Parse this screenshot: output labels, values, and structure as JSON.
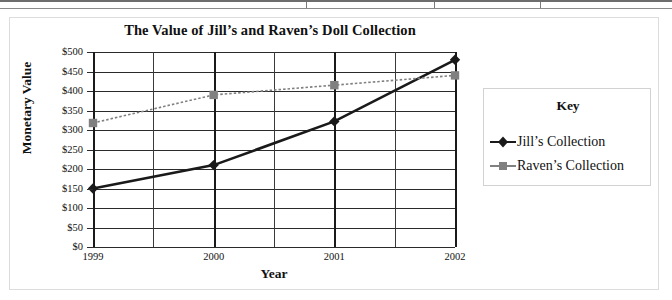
{
  "chart_data": {
    "type": "line",
    "title": "The Value of Jill’s and Raven’s Doll Collection",
    "xlabel": "Year",
    "ylabel": "Monetary Value",
    "categories": [
      "1999",
      "2000",
      "2001",
      "2002"
    ],
    "x": [
      1999,
      2000,
      2001,
      2002
    ],
    "series": [
      {
        "name": "Jill’s Collection",
        "values": [
          150,
          210,
          322,
          480
        ],
        "color": "#1a1a1a",
        "marker": "diamond",
        "line_style": "solid"
      },
      {
        "name": "Raven’s Collection",
        "values": [
          318,
          390,
          415,
          440
        ],
        "color": "#808080",
        "marker": "square",
        "line_style": "dotted"
      }
    ],
    "ylim": [
      0,
      500
    ],
    "ytick_labels": [
      "$500",
      "$450",
      "$400",
      "$350",
      "$300",
      "$250",
      "$200",
      "$150",
      "$100",
      "$50",
      "$0"
    ],
    "ytick_values": [
      500,
      450,
      400,
      350,
      300,
      250,
      200,
      150,
      100,
      50,
      0
    ],
    "ytick_step": 50,
    "grid": true,
    "grid_horizontal": true,
    "grid_vertical": true,
    "legend_position": "right",
    "legend_title": "Key"
  },
  "legend": {
    "title": "Key",
    "entries": [
      {
        "label": "Jill’s Collection",
        "marker": "diamond-marker-icon",
        "color": "#1a1a1a"
      },
      {
        "label": "Raven’s Collection",
        "marker": "square-marker-icon",
        "color": "#808080"
      }
    ]
  },
  "colors": {
    "jill": "#1a1a1a",
    "raven": "#808080",
    "grid": "#2b2b2b",
    "frame": "#dcdcdc",
    "background": "#ffffff"
  }
}
